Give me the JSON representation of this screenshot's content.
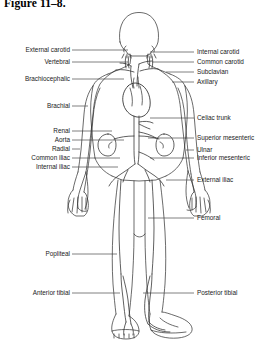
{
  "figure": {
    "title": "Figure 11–8."
  },
  "colors": {
    "background": "#ffffff",
    "ink": "#000000",
    "label_text": "#1a1a1a",
    "leader_line": "#3a3a3a",
    "vessel_line": "#2b2b2b"
  },
  "labels": {
    "left": [
      {
        "text": "External carotid",
        "y": 50,
        "leader_to": 128
      },
      {
        "text": "Vertebral",
        "y": 62,
        "leader_to": 128
      },
      {
        "text": "Brachiocephalic",
        "y": 79,
        "leader_to": 124
      },
      {
        "text": "Brachial",
        "y": 106,
        "leader_to": 88
      },
      {
        "text": "Renal",
        "y": 131,
        "leader_to": 112
      },
      {
        "text": "Aorta",
        "y": 140,
        "leader_to": 124
      },
      {
        "text": "Radial",
        "y": 149,
        "leader_to": 80
      },
      {
        "text": "Common iliac",
        "y": 158,
        "leader_to": 120
      },
      {
        "text": "Internal iliac",
        "y": 167,
        "leader_to": 118
      },
      {
        "text": "Popliteal",
        "y": 254,
        "leader_to": 117
      },
      {
        "text": "Anterior tibial",
        "y": 293,
        "leader_to": 120
      }
    ],
    "right": [
      {
        "text": "Internal carotid",
        "y": 52,
        "leader_from": 150
      },
      {
        "text": "Common carotid",
        "y": 62,
        "leader_from": 152
      },
      {
        "text": "Subclavian",
        "y": 72,
        "leader_from": 166
      },
      {
        "text": "Axillary",
        "y": 82,
        "leader_from": 172
      },
      {
        "text": "Celiac trunk",
        "y": 118,
        "leader_from": 150
      },
      {
        "text": "Superior mesenteric",
        "y": 138,
        "leader_from": 148
      },
      {
        "text": "Ulnar",
        "y": 150,
        "leader_from": 186
      },
      {
        "text": "Inferior mesenteric",
        "y": 158,
        "leader_from": 150
      },
      {
        "text": "External iliac",
        "y": 180,
        "leader_from": 166
      },
      {
        "text": "Femoral",
        "y": 218,
        "leader_from": 148
      },
      {
        "text": "Posterior tibial",
        "y": 293,
        "leader_from": 143
      }
    ]
  }
}
